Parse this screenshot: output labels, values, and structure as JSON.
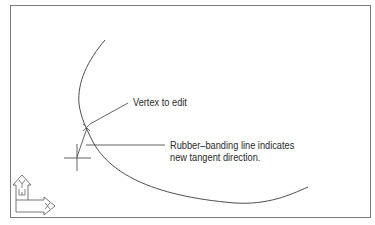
{
  "diagram": {
    "annotations": {
      "vertex": "Vertex to edit",
      "rubber_line1": "Rubber–banding line indicates",
      "rubber_line2": "new tangent direction."
    },
    "ucs_icon": {
      "y_label": "Y",
      "w_label": "W",
      "x_label": "X"
    },
    "colors": {
      "line": "#3a3a3a",
      "frame": "#7a7a7a",
      "background": "#ffffff"
    }
  }
}
